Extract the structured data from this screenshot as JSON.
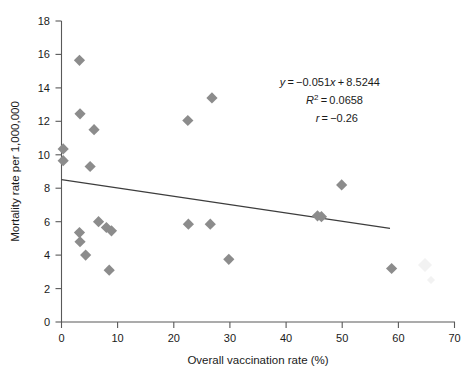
{
  "chart_data": {
    "type": "scatter",
    "title": "",
    "xlabel": "Overall vaccination rate (%)",
    "ylabel": "Mortality rate per 1,000,000",
    "xlim": [
      0,
      70
    ],
    "ylim": [
      0,
      18
    ],
    "xticks": [
      0,
      10,
      20,
      30,
      40,
      50,
      60,
      70
    ],
    "yticks": [
      0,
      2,
      4,
      6,
      8,
      10,
      12,
      14,
      16,
      18
    ],
    "xtick_labels": [
      "0",
      "10",
      "20",
      "30",
      "40",
      "50",
      "60",
      "70"
    ],
    "ytick_labels": [
      "0",
      "2",
      "4",
      "6",
      "8",
      "10",
      "12",
      "14",
      "16",
      "18"
    ],
    "grid": false,
    "legend": false,
    "marker_shape": "diamond",
    "marker_color": "#8c8c8c",
    "points": [
      {
        "x": 0.3,
        "y": 10.35
      },
      {
        "x": 0.3,
        "y": 9.65
      },
      {
        "x": 3.2,
        "y": 15.65
      },
      {
        "x": 3.3,
        "y": 12.45
      },
      {
        "x": 3.2,
        "y": 5.35
      },
      {
        "x": 3.3,
        "y": 4.8
      },
      {
        "x": 4.3,
        "y": 4.0
      },
      {
        "x": 5.8,
        "y": 11.5
      },
      {
        "x": 5.1,
        "y": 9.3
      },
      {
        "x": 6.6,
        "y": 6.0
      },
      {
        "x": 8.0,
        "y": 5.65
      },
      {
        "x": 8.9,
        "y": 5.45
      },
      {
        "x": 8.5,
        "y": 3.1
      },
      {
        "x": 22.5,
        "y": 12.05
      },
      {
        "x": 22.6,
        "y": 5.85
      },
      {
        "x": 26.5,
        "y": 5.85
      },
      {
        "x": 26.8,
        "y": 13.4
      },
      {
        "x": 29.8,
        "y": 3.75
      },
      {
        "x": 45.6,
        "y": 6.35
      },
      {
        "x": 46.3,
        "y": 6.3
      },
      {
        "x": 49.9,
        "y": 8.2
      },
      {
        "x": 58.8,
        "y": 3.2
      }
    ],
    "trendline": {
      "slope": -0.051,
      "intercept": 8.5244,
      "x_start": 0,
      "x_end": 58.5
    },
    "annotations": {
      "equation": "y = −0.051x + 8.5244",
      "equation_parts": {
        "y": "y",
        "eq": " = −0.051",
        "x": "x",
        "tail": " + 8.5244"
      },
      "r_squared": {
        "symbol": "R",
        "exponent": "2",
        "value": " = 0.0658"
      },
      "r_value": {
        "symbol": "r",
        "value": " = −0.26"
      }
    }
  }
}
